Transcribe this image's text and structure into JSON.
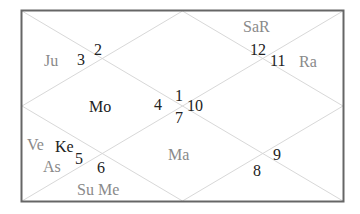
{
  "chart": {
    "type": "north-indian-horoscope",
    "frame_color": "#666666",
    "line_color": "#d8d8d8",
    "houses": [
      {
        "number": "1",
        "planets": ""
      },
      {
        "number": "2",
        "planets": ""
      },
      {
        "number": "3",
        "planets": "Ju"
      },
      {
        "number": "4",
        "planets": "Mo"
      },
      {
        "number": "5",
        "planets": "Ke"
      },
      {
        "number": "6",
        "planets": "Su Me"
      },
      {
        "number": "7",
        "planets": "Ma"
      },
      {
        "number": "8",
        "planets": ""
      },
      {
        "number": "9",
        "planets": ""
      },
      {
        "number": "10",
        "planets": ""
      },
      {
        "number": "11",
        "planets": "Ra"
      },
      {
        "number": "12",
        "planets": "SaR"
      }
    ],
    "extra_labels": {
      "ve": "Ve",
      "as": "As"
    }
  }
}
